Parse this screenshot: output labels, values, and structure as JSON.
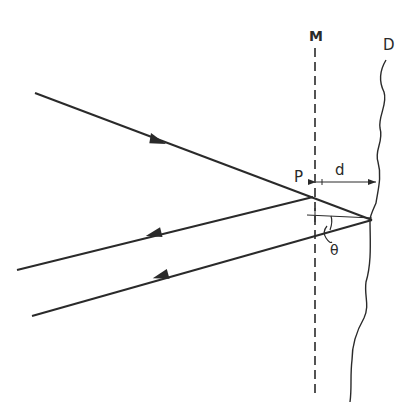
{
  "diagram": {
    "labels": {
      "mirror": "M",
      "surface": "D",
      "point": "P",
      "distance": "d",
      "angle": "θ"
    },
    "colors": {
      "ink": "#2a2a2a",
      "background": "#ffffff"
    },
    "elements": {
      "mirror_line": "dashed vertical line M",
      "surface_line": "wavy surface D",
      "incident_ray": "incident ray toward P",
      "reflected_ray_1": "reflected ray from P",
      "reflected_ray_2": "reflected ray from surface D",
      "distance_marker": "d between M and D",
      "angle_marker": "θ angle at surface"
    }
  }
}
